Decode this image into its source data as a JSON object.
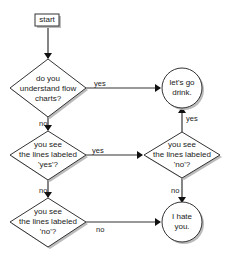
{
  "diagram": {
    "type": "flowchart",
    "nodes": [
      {
        "id": "start",
        "shape": "rectangle",
        "label": "start"
      },
      {
        "id": "q1",
        "shape": "diamond",
        "lines": [
          "do you",
          "understand flow",
          "charts?"
        ]
      },
      {
        "id": "drink",
        "shape": "circle",
        "lines": [
          "let's go",
          "drink."
        ]
      },
      {
        "id": "q2",
        "shape": "diamond",
        "lines": [
          "you see",
          "the lines labeled",
          "'yes'?"
        ]
      },
      {
        "id": "q3",
        "shape": "diamond",
        "lines": [
          "you see",
          "the lines labeled",
          "'no'?"
        ]
      },
      {
        "id": "q4",
        "shape": "diamond",
        "lines": [
          "you see",
          "the lines labeled",
          "'no'?"
        ]
      },
      {
        "id": "hate",
        "shape": "circle",
        "lines": [
          "I hate",
          "you."
        ]
      }
    ],
    "edges": [
      {
        "from": "start",
        "to": "q1",
        "label": ""
      },
      {
        "from": "q1",
        "to": "drink",
        "label": "yes"
      },
      {
        "from": "q1",
        "to": "q2",
        "label": "no"
      },
      {
        "from": "q2",
        "to": "q3",
        "label": "yes"
      },
      {
        "from": "q2",
        "to": "q4",
        "label": "no"
      },
      {
        "from": "q3",
        "to": "drink",
        "label": "yes"
      },
      {
        "from": "q3",
        "to": "hate",
        "label": "no"
      },
      {
        "from": "q4",
        "to": "hate",
        "label": "no"
      }
    ]
  },
  "colors": {
    "stroke": "#333333",
    "fill": "#ffffff",
    "shadow": "#aaaaaa",
    "text": "#222222"
  }
}
